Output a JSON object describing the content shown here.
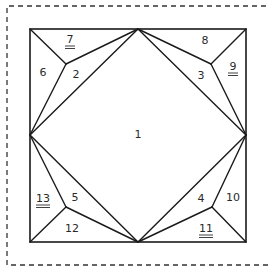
{
  "diagram": {
    "title": "",
    "colors": {
      "line": "#1a1a1a",
      "text": "#2a2a2a",
      "background": "#ffffff",
      "dashed_border": "#333333"
    },
    "dashed_border": {
      "x": 7,
      "y": 6,
      "right": 275,
      "bottom": 265
    },
    "square": {
      "x1": 30,
      "y1": 29,
      "x2": 246,
      "y2": 242
    },
    "points": {
      "TL": [
        30,
        29
      ],
      "TM": [
        138,
        29
      ],
      "TR": [
        246,
        29
      ],
      "ML": [
        30,
        135
      ],
      "MR": [
        246,
        135
      ],
      "BL": [
        30,
        242
      ],
      "BM": [
        138,
        242
      ],
      "BR": [
        246,
        242
      ],
      "P_TL": [
        66,
        64
      ],
      "P_TR": [
        211,
        64
      ],
      "P_BL": [
        66,
        207
      ],
      "P_BR": [
        212,
        207
      ]
    },
    "regions": [
      {
        "id": "1",
        "label": "1",
        "x": 138,
        "y": 134,
        "underlined": false
      },
      {
        "id": "2",
        "label": "2",
        "x": 76,
        "y": 74,
        "underlined": false
      },
      {
        "id": "3",
        "label": "3",
        "x": 201,
        "y": 75,
        "underlined": false
      },
      {
        "id": "4",
        "label": "4",
        "x": 201,
        "y": 198,
        "underlined": false
      },
      {
        "id": "5",
        "label": "5",
        "x": 75,
        "y": 197,
        "underlined": false
      },
      {
        "id": "6",
        "label": "6",
        "x": 43,
        "y": 72,
        "underlined": false
      },
      {
        "id": "7",
        "label": "7",
        "x": 70,
        "y": 39,
        "underlined": true
      },
      {
        "id": "8",
        "label": "8",
        "x": 205,
        "y": 40,
        "underlined": false
      },
      {
        "id": "9",
        "label": "9",
        "x": 233,
        "y": 66,
        "underlined": true
      },
      {
        "id": "10",
        "label": "10",
        "x": 233,
        "y": 197,
        "underlined": false
      },
      {
        "id": "11",
        "label": "11",
        "x": 206,
        "y": 228,
        "underlined": true
      },
      {
        "id": "12",
        "label": "12",
        "x": 72,
        "y": 228,
        "underlined": false
      },
      {
        "id": "13",
        "label": "13",
        "x": 43,
        "y": 198,
        "underlined": true
      }
    ]
  }
}
